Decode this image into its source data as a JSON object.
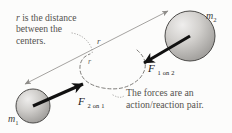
{
  "figure": {
    "background_color": "#fcfcfb"
  },
  "annotations": {
    "distance_note": {
      "line1_prefix": "r",
      "line1_rest": " is the distance",
      "line2": "between the",
      "line3": "centers."
    },
    "pair_note": {
      "line1": "The forces are an",
      "line2": "action/reaction pair."
    }
  },
  "bodies": [
    {
      "id": "mass-one",
      "label_base": "m",
      "label_sub": "1",
      "cx": 33,
      "cy": 106,
      "r": 17,
      "fill_light": "#e8e7e5",
      "fill_dark": "#9c9a97",
      "stroke": "#4b4a48"
    },
    {
      "id": "mass-two",
      "label_base": "m",
      "label_sub": "2",
      "cx": 190,
      "cy": 36,
      "r": 25,
      "fill_light": "#eceae8",
      "fill_dark": "#9f9d9a",
      "stroke": "#4b4a48"
    }
  ],
  "vectors": [
    {
      "id": "force-1-on-2",
      "symbol": "F",
      "subscript": "1 on 2",
      "from": [
        190,
        36
      ],
      "to": [
        139,
        66
      ],
      "color": "#111111"
    },
    {
      "id": "force-2-on-1",
      "symbol": "F",
      "subscript": "2 on 1",
      "from": [
        33,
        106
      ],
      "to": [
        87,
        82
      ],
      "color": "#111111"
    }
  ],
  "dimension_line": {
    "id": "center-to-center",
    "label": "r",
    "from": [
      25,
      84
    ],
    "to": [
      168,
      11
    ],
    "color": "#8e8c89"
  },
  "arc_label": {
    "label": "r"
  },
  "colors": {
    "text": "#55534f",
    "vector": "#111111",
    "dimension": "#8e8c89",
    "dashed_arc": "#6f6d6a",
    "dotted_leader": "#8b8986"
  }
}
